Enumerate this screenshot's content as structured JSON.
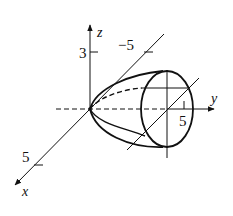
{
  "figure": {
    "type": "3d-surface-sketch",
    "axes": {
      "x": {
        "label": "x",
        "tick_positive": "5",
        "tick_negative": "−5"
      },
      "y": {
        "label": "y",
        "tick": "5"
      },
      "z": {
        "label": "z",
        "tick": "3"
      }
    },
    "colors": {
      "stroke": "#111111",
      "background": "#ffffff"
    }
  }
}
